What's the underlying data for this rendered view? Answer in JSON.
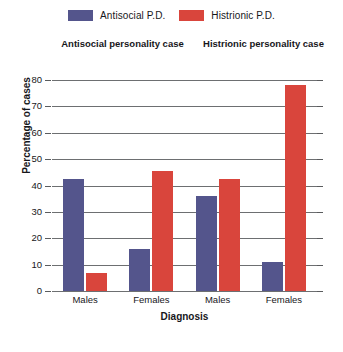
{
  "chart_data": {
    "type": "bar",
    "title": "",
    "xlabel": "Diagnosis",
    "ylabel": "Percentage of cases",
    "ylim": [
      0,
      80
    ],
    "ytick_step": 10,
    "yticks": [
      80,
      70,
      60,
      50,
      40,
      30,
      20,
      10,
      0
    ],
    "grid": true,
    "legend_position": "top",
    "categories": [
      "Males",
      "Females",
      "Males",
      "Females"
    ],
    "group_headings": [
      "Antisocial personality case",
      "Histrionic personality case"
    ],
    "series": [
      {
        "name": "Antisocial P.D.",
        "color": "#54558c",
        "values": [
          42.5,
          16,
          36,
          11
        ]
      },
      {
        "name": "Histrionic P.D.",
        "color": "#d9453c",
        "values": [
          7,
          45.5,
          42.5,
          78
        ]
      }
    ],
    "colors": {
      "antisocial": "#54558c",
      "histrionic": "#d9453c",
      "gridline": "#6d6f71",
      "text": "#17171b",
      "background": "#ffffff"
    }
  }
}
